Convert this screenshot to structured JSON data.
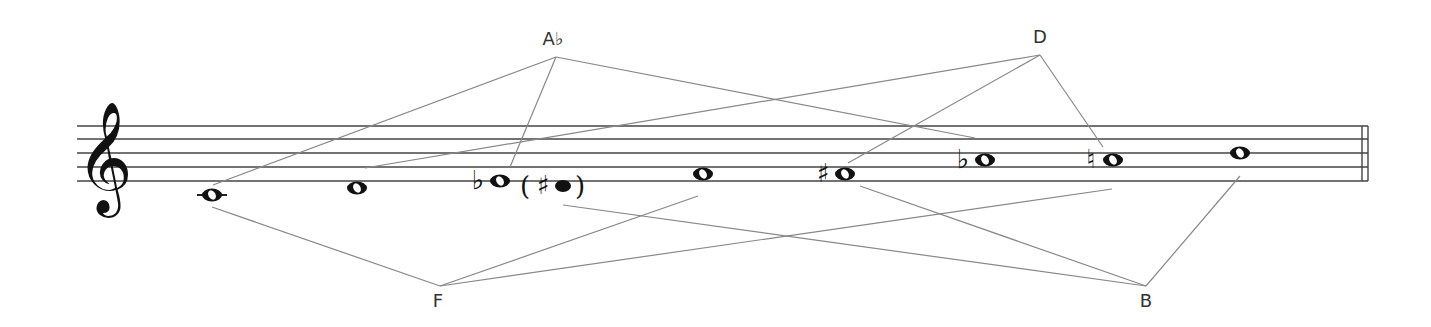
{
  "diagram": {
    "type": "music-staff-interval-diagram",
    "clef": "treble",
    "staff": {
      "x_start": 77,
      "x_end": 1368,
      "line_y": [
        126,
        139,
        153,
        167,
        181
      ],
      "line_color": "#444444",
      "final_barline": true
    },
    "notes": [
      {
        "id": "n1",
        "pitch": "C4",
        "accidental": "",
        "x": 212,
        "y": 195,
        "ledger": true,
        "filled": false,
        "parenthetical": false
      },
      {
        "id": "n2",
        "pitch": "D4",
        "accidental": "",
        "x": 357,
        "y": 188,
        "ledger": false,
        "filled": false,
        "parenthetical": false
      },
      {
        "id": "n3",
        "pitch": "Eb4",
        "accidental": "♭",
        "x": 500,
        "y": 181,
        "ledger": false,
        "filled": false,
        "parenthetical": false
      },
      {
        "id": "n4",
        "pitch": "F#4",
        "accidental": "♯",
        "x": 563,
        "y": 186,
        "ledger": false,
        "filled": true,
        "parenthetical": true
      },
      {
        "id": "n5",
        "pitch": "F4",
        "accidental": "",
        "x": 703,
        "y": 174,
        "ledger": false,
        "filled": false,
        "parenthetical": false
      },
      {
        "id": "n6",
        "pitch": "F#4",
        "accidental": "♯",
        "x": 845,
        "y": 174,
        "ledger": false,
        "filled": false,
        "parenthetical": false
      },
      {
        "id": "n7",
        "pitch": "Ab4",
        "accidental": "♭",
        "x": 985,
        "y": 160,
        "ledger": false,
        "filled": false,
        "parenthetical": false
      },
      {
        "id": "n8",
        "pitch": "A4",
        "accidental": "♮",
        "x": 1113,
        "y": 160,
        "ledger": false,
        "filled": false,
        "parenthetical": false
      },
      {
        "id": "n9",
        "pitch": "B4",
        "accidental": "",
        "x": 1240,
        "y": 153,
        "ledger": false,
        "filled": false,
        "parenthetical": false
      }
    ],
    "hubs": [
      {
        "id": "Ab",
        "label": "A♭",
        "label_x": 553,
        "label_y": 28,
        "apex": [
          556,
          57
        ],
        "targets": [
          [
            213,
            185
          ],
          [
            510,
            167
          ],
          [
            975,
            138
          ]
        ]
      },
      {
        "id": "D",
        "label": "D",
        "label_x": 1040,
        "label_y": 26,
        "apex": [
          1040,
          55
        ],
        "targets": [
          [
            365,
            168
          ],
          [
            848,
            163
          ],
          [
            1103,
            147
          ]
        ]
      },
      {
        "id": "F",
        "label": "F",
        "label_x": 438,
        "label_y": 290,
        "apex": [
          440,
          286
        ],
        "targets": [
          [
            212,
            207
          ],
          [
            698,
            196
          ],
          [
            1112,
            189
          ]
        ]
      },
      {
        "id": "B",
        "label": "B",
        "label_x": 1146,
        "label_y": 290,
        "apex": [
          1146,
          286
        ],
        "targets": [
          [
            563,
            205
          ],
          [
            860,
            186
          ],
          [
            1240,
            176
          ]
        ]
      }
    ],
    "connector_color": "#888888",
    "paren_open": "(",
    "paren_close": ")"
  }
}
